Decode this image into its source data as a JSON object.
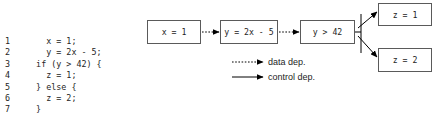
{
  "code_listing": {
    "lines": [
      {
        "number": "1",
        "text": "    x = 1;"
      },
      {
        "number": "2",
        "text": "    y = 2x - 5;"
      },
      {
        "number": "3",
        "text": "  if (y > 42) {"
      },
      {
        "number": "4",
        "text": "    z = 1;"
      },
      {
        "number": "5",
        "text": "  } else {"
      },
      {
        "number": "6",
        "text": "    z = 2;"
      },
      {
        "number": "7",
        "text": "  }"
      }
    ]
  },
  "diagram": {
    "nodes": [
      {
        "id": "x1",
        "label": "x = 1"
      },
      {
        "id": "y2x5",
        "label": "y = 2x - 5"
      },
      {
        "id": "ygt42",
        "label": "y > 42"
      },
      {
        "id": "z1",
        "label": "z = 1"
      },
      {
        "id": "z2",
        "label": "z = 2"
      }
    ],
    "edges": [
      {
        "from": "x1",
        "to": "y2x5",
        "kind": "data"
      },
      {
        "from": "y2x5",
        "to": "ygt42",
        "kind": "data"
      },
      {
        "from": "ygt42",
        "to": "z1",
        "kind": "control"
      },
      {
        "from": "ygt42",
        "to": "z2",
        "kind": "control"
      }
    ],
    "colors": {
      "box_border": "#5a5a5a",
      "edge": "#000000",
      "text": "#1d1d1d",
      "background": "#ffffff"
    }
  },
  "legend": {
    "data_dep_label": "data dep.",
    "control_dep_label": "control dep."
  }
}
